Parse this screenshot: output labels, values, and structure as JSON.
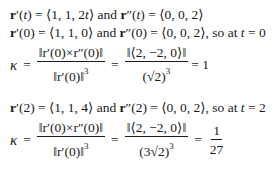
{
  "lines": {
    "l1": {
      "a": "r",
      "b": "′(",
      "t": "t",
      "c": ") = ⟨1, 1, 2",
      "t2": "t",
      "d": "⟩ and ",
      "e": "r",
      "f": "″(",
      "g": "t",
      "h": ") = ⟨0, 0, 2⟩"
    },
    "l2": {
      "a": "r",
      "b": "′(0) = ⟨1, 1, 0⟩ and ",
      "c": "r",
      "d": "″(0) = ⟨0, 0, 2⟩, so at ",
      "t": "t",
      "e": " = 0"
    },
    "l4": {
      "a": "r",
      "b": "′(2) = ⟨1, 1, 4⟩ and ",
      "c": "r",
      "d": "″(2) = ⟨0, 0, 2⟩, so at ",
      "t": "t",
      "e": " = 2"
    }
  },
  "frac1": {
    "kappa": "κ",
    "eq": "=",
    "num1": "‖r′(0)×r″(0)‖",
    "den1": "‖r′(0)‖",
    "den1_exp": "3",
    "num2": "‖⟨2, −2, 0⟩‖",
    "den2": "(√2)",
    "den2_exp": "3",
    "result": "= 1"
  },
  "frac2": {
    "kappa": "κ",
    "eq": "=",
    "num1": "‖r′(0)×r″(0)‖",
    "den1": "‖r′(0)‖",
    "den1_exp": "3",
    "num2": "‖⟨2, −2, 0⟩‖",
    "den2": "(3√2)",
    "den2_exp": "3",
    "res_num": "1",
    "res_den": "27"
  }
}
